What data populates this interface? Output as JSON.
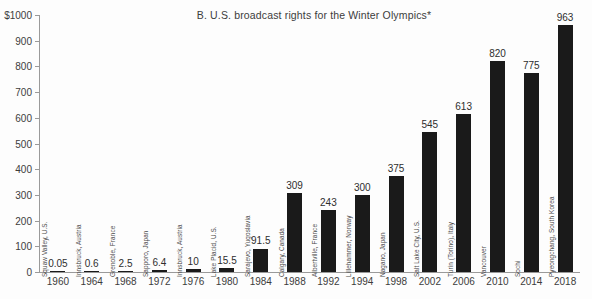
{
  "chart_data": {
    "type": "bar",
    "title": "B.  U.S. broadcast rights for the Winter Olympics*",
    "xlabel": "",
    "ylabel": "",
    "ylim": [
      0,
      1000
    ],
    "grid": false,
    "legend": "none",
    "y_axis_top_label": "$1000",
    "y_ticks": [
      0,
      100,
      200,
      300,
      400,
      500,
      600,
      700,
      800,
      900,
      1000
    ],
    "y_tick_labels": [
      "0",
      "100",
      "200",
      "300",
      "400",
      "500",
      "600",
      "700",
      "800",
      "900",
      "$1000"
    ],
    "categories": [
      "1960",
      "1964",
      "1968",
      "1972",
      "1976",
      "1980",
      "1984",
      "1988",
      "1992",
      "1994",
      "1998",
      "2002",
      "2006",
      "2010",
      "2014",
      "2018"
    ],
    "values": [
      0.05,
      0.6,
      2.5,
      6.4,
      10,
      15.5,
      91.5,
      309,
      243,
      300,
      375,
      545,
      613,
      820,
      775,
      963
    ],
    "value_labels": [
      "0.05",
      "0.6",
      "2.5",
      "6.4",
      "10",
      "15.5",
      "91.5",
      "309",
      "243",
      "300",
      "375",
      "545",
      "613",
      "820",
      "775",
      "963"
    ],
    "point_labels": [
      "Squaw Valley, U.S.",
      "Innsbruck, Austria",
      "Grenoble, France",
      "Sapporo, Japan",
      "Innsbruck, Austria",
      "Lake Placid, U.S.",
      "Sarajevo, Yugoslavia",
      "Calgary, Canada",
      "Albertville, France",
      "Lillehammer, Norway",
      "Nagano, Japan",
      "Salt Lake City, U.S.",
      "Turin (Torino), Italy",
      "Vancouver",
      "Sochi",
      "Pyeongchang, South Korea"
    ],
    "bar_color": "#1a1a1a",
    "axis_color": "#9a9a9a",
    "background_color": "#fdfdfd"
  }
}
